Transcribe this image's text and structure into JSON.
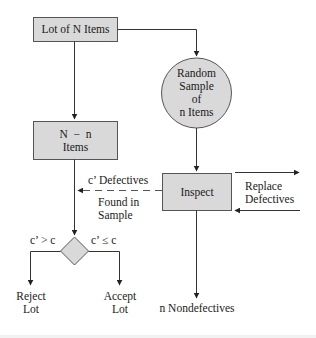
{
  "diagram": {
    "type": "flowchart",
    "colors": {
      "node_fill": "#d9d9d9",
      "node_stroke": "#555555",
      "line": "#333333",
      "text": "#1a1a1a",
      "background": "#ffffff"
    },
    "nodes": {
      "lot": {
        "shape": "rectangle",
        "lines": [
          "Lot of N Items"
        ]
      },
      "sample": {
        "shape": "circle",
        "lines": [
          "Random",
          "Sample",
          "of",
          "n Items"
        ]
      },
      "remaining": {
        "shape": "rectangle",
        "lines": [
          "N  −  n",
          "Items"
        ]
      },
      "inspect": {
        "shape": "rectangle",
        "lines": [
          "Inspect"
        ]
      },
      "decision": {
        "shape": "diamond",
        "lines": []
      }
    },
    "edge_labels": {
      "defectives_line1": "c’ Defectives",
      "defectives_line2": "Found in",
      "defectives_line3": "Sample",
      "replace_line1": "Replace",
      "replace_line2": "Defectives",
      "reject_condition": "c’ > c",
      "accept_condition": "c’ ≤ c"
    },
    "terminals": {
      "reject_line1": "Reject",
      "reject_line2": "Lot",
      "accept_line1": "Accept",
      "accept_line2": "Lot",
      "nondefectives": "n Nondefectives"
    },
    "edges": [
      {
        "from": "lot",
        "to": "remaining",
        "style": "solid"
      },
      {
        "from": "lot",
        "to": "sample",
        "style": "solid"
      },
      {
        "from": "sample",
        "to": "inspect",
        "style": "solid"
      },
      {
        "from": "inspect",
        "to": "decision",
        "style": "dashed",
        "label": "c’ Defectives Found in Sample"
      },
      {
        "from": "remaining",
        "to": "decision",
        "style": "solid"
      },
      {
        "from": "decision",
        "to": "reject",
        "style": "solid",
        "label": "c’ > c"
      },
      {
        "from": "decision",
        "to": "accept",
        "style": "solid",
        "label": "c’ ≤ c"
      },
      {
        "from": "inspect",
        "to": "replace",
        "style": "solid",
        "label": "Replace Defectives"
      },
      {
        "from": "replace",
        "to": "inspect",
        "style": "solid"
      },
      {
        "from": "inspect",
        "to": "nondefectives",
        "style": "solid"
      }
    ]
  }
}
